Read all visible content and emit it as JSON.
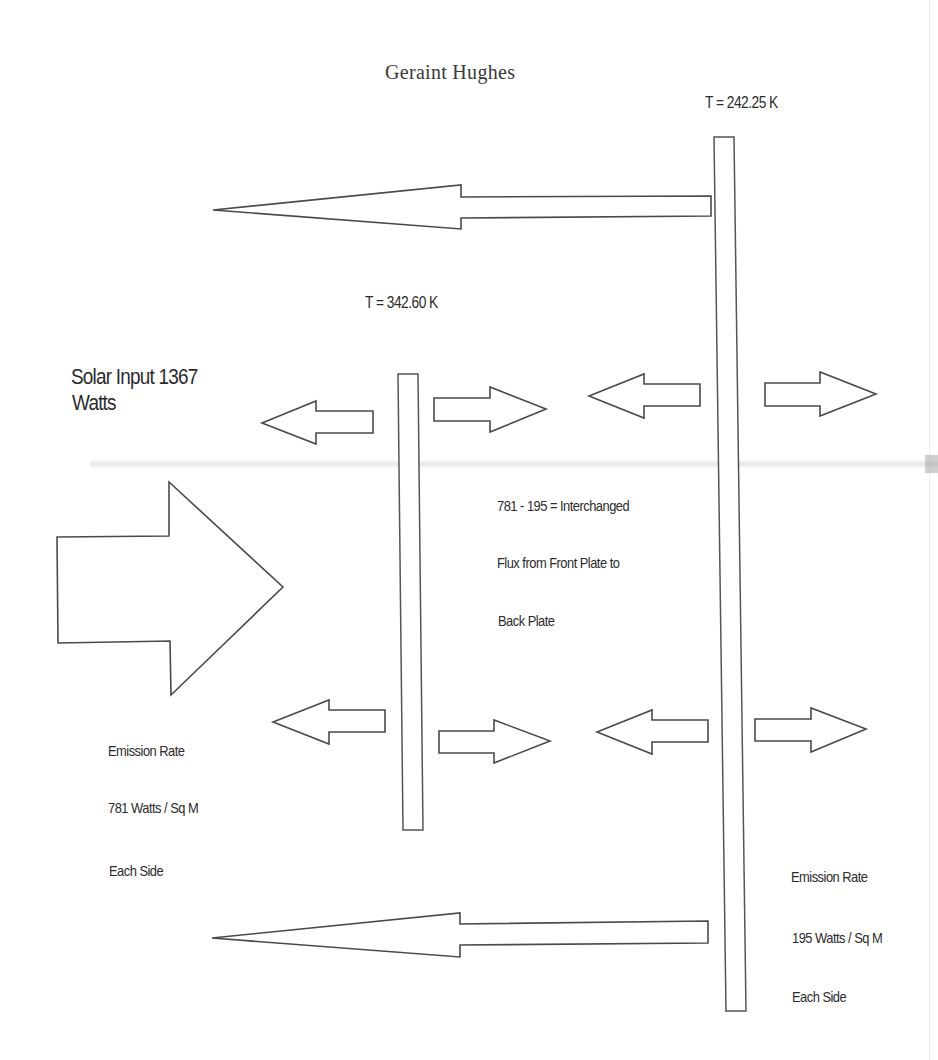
{
  "header": {
    "author": "Geraint Hughes"
  },
  "plates": {
    "front": {
      "name": "Front Plate",
      "temperature_label": "T = 342.60 K",
      "emission_rate_title": "Emission Rate",
      "emission_rate_value": "781 Watts / Sq M",
      "emission_rate_scope": "Each Side"
    },
    "back": {
      "name": "Back Plate",
      "temperature_label": "T = 242.25 K",
      "emission_rate_title": "Emission Rate",
      "emission_rate_value": "195 Watts / Sq M",
      "emission_rate_scope": "Each Side"
    }
  },
  "solar_input": {
    "line1": "Solar Input 1367",
    "line2": "Watts"
  },
  "interchange_note": {
    "line1": "781 - 195 =  Interchanged",
    "line2": "Flux from Front Plate to",
    "line3": "Back Plate"
  },
  "arrows": [
    {
      "id": "back-plate-outward-top",
      "direction": "left",
      "style": "long"
    },
    {
      "id": "front-plate-left-upper",
      "direction": "left",
      "style": "block"
    },
    {
      "id": "front-plate-right-upper",
      "direction": "right",
      "style": "block"
    },
    {
      "id": "back-plate-left-upper",
      "direction": "left",
      "style": "block"
    },
    {
      "id": "back-plate-right-upper",
      "direction": "right",
      "style": "block"
    },
    {
      "id": "solar-input",
      "direction": "right",
      "style": "large-block"
    },
    {
      "id": "front-plate-left-lower",
      "direction": "left",
      "style": "block"
    },
    {
      "id": "front-plate-right-lower",
      "direction": "right",
      "style": "block"
    },
    {
      "id": "back-plate-left-lower",
      "direction": "left",
      "style": "block"
    },
    {
      "id": "back-plate-right-lower",
      "direction": "right",
      "style": "block"
    },
    {
      "id": "back-plate-outward-bottom",
      "direction": "left",
      "style": "long"
    }
  ],
  "colors": {
    "background": "#ffffff",
    "stroke": "#4a4a4a",
    "text": "#2c2c2c"
  }
}
